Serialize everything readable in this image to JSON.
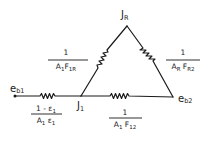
{
  "diagram": {
    "title": "",
    "type": "radiation-network",
    "nodes": [
      {
        "id": "eb1",
        "label": "e",
        "subscript": "b1"
      },
      {
        "id": "J1",
        "label": "J",
        "subscript": "1"
      },
      {
        "id": "JR",
        "label": "J",
        "subscript": "R"
      },
      {
        "id": "eb2",
        "label": "e",
        "subscript": "b2"
      }
    ],
    "resistors": [
      {
        "id": "r-eb1-J1",
        "from": "eb1",
        "to": "J1",
        "numerator": "1 - ε",
        "numerator_sub": "1",
        "denominator": "A",
        "denominator_sub1": "1",
        "denominator_mid": " ε",
        "denominator_sub2": "1"
      },
      {
        "id": "r-J1-JR",
        "from": "J1",
        "to": "JR",
        "numerator": "1",
        "denominator": "A",
        "denominator_sub1": "1",
        "denominator_mid": "F",
        "denominator_sub2": "1R"
      },
      {
        "id": "r-JR-eb2",
        "from": "JR",
        "to": "eb2",
        "numerator": "1",
        "denominator": "A",
        "denominator_sub1": "R",
        "denominator_mid": " F",
        "denominator_sub2": "R2"
      },
      {
        "id": "r-J1-eb2",
        "from": "J1",
        "to": "eb2",
        "numerator": "1",
        "denominator": "A",
        "denominator_sub1": "1",
        "denominator_mid": " F",
        "denominator_sub2": "12"
      }
    ]
  }
}
